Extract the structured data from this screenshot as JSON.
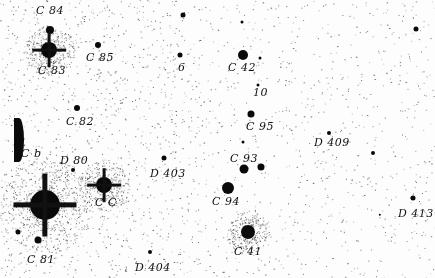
{
  "image": {
    "description": "Negative photographic star field finder chart with handwritten star designations",
    "background_color": "#fdfdfd",
    "ink_color": "#111111"
  },
  "labels": [
    {
      "id": "C84",
      "text": "C 84",
      "x": 36,
      "y": 5
    },
    {
      "id": "C83",
      "text": "C 83",
      "x": 38,
      "y": 65
    },
    {
      "id": "C85",
      "text": "C 85",
      "x": 86,
      "y": 52
    },
    {
      "id": "6",
      "text": "6",
      "x": 178,
      "y": 62
    },
    {
      "id": "C42",
      "text": "C 42",
      "x": 228,
      "y": 62
    },
    {
      "id": "10",
      "text": "10",
      "x": 253,
      "y": 87
    },
    {
      "id": "C82",
      "text": "C 82",
      "x": 66,
      "y": 116
    },
    {
      "id": "C95",
      "text": "C 95",
      "x": 246,
      "y": 121
    },
    {
      "id": "D409",
      "text": "D 409",
      "x": 314,
      "y": 137
    },
    {
      "id": "Cb",
      "text": "C b",
      "x": 21,
      "y": 148
    },
    {
      "id": "D80",
      "text": "D 80",
      "x": 60,
      "y": 155
    },
    {
      "id": "D403",
      "text": "D 403",
      "x": 150,
      "y": 168
    },
    {
      "id": "C93",
      "text": "C 93",
      "x": 230,
      "y": 153
    },
    {
      "id": "CC",
      "text": "C C",
      "x": 95,
      "y": 197
    },
    {
      "id": "C94",
      "text": "C 94",
      "x": 212,
      "y": 196
    },
    {
      "id": "D413",
      "text": "D 413",
      "x": 398,
      "y": 208
    },
    {
      "id": "C81",
      "text": "C 81",
      "x": 27,
      "y": 254
    },
    {
      "id": "C41",
      "text": "C 41",
      "x": 234,
      "y": 246
    },
    {
      "id": "D404",
      "text": "D 404",
      "x": 135,
      "y": 262
    }
  ],
  "stars": [
    {
      "name": "C84",
      "x": 50,
      "y": 30,
      "r": 4
    },
    {
      "name": "C83",
      "x": 49,
      "y": 50,
      "r": 8,
      "spikes": true
    },
    {
      "name": "C85",
      "x": 98,
      "y": 45,
      "r": 3
    },
    {
      "name": "field-top",
      "x": 183,
      "y": 15,
      "r": 2.5
    },
    {
      "name": "field-top-2",
      "x": 242,
      "y": 22,
      "r": 1.5
    },
    {
      "name": "6",
      "x": 180,
      "y": 55,
      "r": 2.5
    },
    {
      "name": "C42",
      "x": 243,
      "y": 55,
      "r": 5
    },
    {
      "name": "C42-companion",
      "x": 260,
      "y": 58,
      "r": 1.5
    },
    {
      "name": "field-right",
      "x": 416,
      "y": 29,
      "r": 2.5
    },
    {
      "name": "10-star",
      "x": 258,
      "y": 85,
      "r": 1.5
    },
    {
      "name": "C82",
      "x": 77,
      "y": 108,
      "r": 3
    },
    {
      "name": "C95",
      "x": 251,
      "y": 114,
      "r": 3.5
    },
    {
      "name": "D409",
      "x": 329,
      "y": 133,
      "r": 2
    },
    {
      "name": "field-mid-right",
      "x": 373,
      "y": 153,
      "r": 2
    },
    {
      "name": "D80",
      "x": 73,
      "y": 170,
      "r": 2
    },
    {
      "name": "D403",
      "x": 164,
      "y": 158,
      "r": 2.5
    },
    {
      "name": "C93-small",
      "x": 243,
      "y": 142,
      "r": 1.5
    },
    {
      "name": "C93",
      "x": 244,
      "y": 169,
      "r": 4.5
    },
    {
      "name": "C93-companion",
      "x": 261,
      "y": 167,
      "r": 3.5
    },
    {
      "name": "CC",
      "x": 104,
      "y": 185,
      "r": 8,
      "spikes": true
    },
    {
      "name": "C94",
      "x": 228,
      "y": 188,
      "r": 6
    },
    {
      "name": "D413",
      "x": 413,
      "y": 198,
      "r": 2.5
    },
    {
      "name": "bright-left",
      "x": 45,
      "y": 205,
      "r": 15,
      "spikes": true
    },
    {
      "name": "C81",
      "x": 38,
      "y": 240,
      "r": 3.5
    },
    {
      "name": "C41",
      "x": 248,
      "y": 232,
      "r": 7
    },
    {
      "name": "D404",
      "x": 150,
      "y": 252,
      "r": 2
    },
    {
      "name": "field-low-right",
      "x": 380,
      "y": 215,
      "r": 1.2
    },
    {
      "name": "left-edge-small",
      "x": 18,
      "y": 232,
      "r": 2.5
    }
  ]
}
